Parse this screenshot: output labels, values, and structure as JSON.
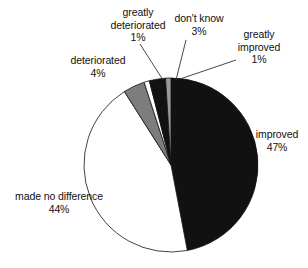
{
  "chart_data": {
    "type": "pie",
    "title": "",
    "subtitle": "",
    "xlabel": "",
    "ylabel": "",
    "legend_position": "none",
    "grid": false,
    "labels_outside": true,
    "start_angle_deg": 0,
    "direction": "clockwise",
    "categories": [
      "improved",
      "made no difference",
      "deteriorated",
      "greatly deteriorated",
      "don't know",
      "greatly improved"
    ],
    "values": [
      47,
      44,
      4,
      1,
      3,
      1
    ],
    "value_labels": [
      "47%",
      "44%",
      "4%",
      "1%",
      "3%",
      "1%"
    ],
    "colors": [
      "#111111",
      "#ffffff",
      "#7d7d7d",
      "#ffffff",
      "#111111",
      "#9a9a9a"
    ],
    "slice_border_color": "#111111",
    "units": "percent",
    "total": 100
  },
  "slices": [
    {
      "name": "improved",
      "percent_label": "47%",
      "color": "#111111",
      "start_pct": 0,
      "end_pct": 47,
      "explode": 0
    },
    {
      "name": "made no difference",
      "percent_label": "44%",
      "color": "#ffffff",
      "start_pct": 47,
      "end_pct": 91,
      "explode": 0
    },
    {
      "name": "deteriorated",
      "percent_label": "4%",
      "color": "#7d7d7d",
      "start_pct": 91,
      "end_pct": 95,
      "explode": 0
    },
    {
      "name": "greatly deteriorated",
      "percent_label": "1%",
      "color": "#ffffff",
      "start_pct": 95,
      "end_pct": 96,
      "explode": 0
    },
    {
      "name": "don't know",
      "percent_label": "3%",
      "color": "#111111",
      "start_pct": 96,
      "end_pct": 99,
      "explode": 0
    },
    {
      "name": "greatly improved",
      "percent_label": "1%",
      "color": "#9a9a9a",
      "start_pct": 99,
      "end_pct": 100,
      "explode": 0
    }
  ],
  "labels": {
    "greatly_deteriorated": {
      "line1": "greatly",
      "line2": "deteriorated",
      "percent": "1%"
    },
    "dont_know": {
      "line1": "don't know",
      "percent": "3%"
    },
    "greatly_improved": {
      "line1": "greatly",
      "line2": "improved",
      "percent": "1%"
    },
    "deteriorated": {
      "line1": "deteriorated",
      "percent": "4%"
    },
    "improved": {
      "line1": "improved",
      "percent": "47%"
    },
    "made_no_difference": {
      "line1": "made no difference",
      "percent": "44%"
    }
  },
  "geometry": {
    "center_x": 171,
    "center_y": 165,
    "radius": 87
  },
  "style": {
    "background": "#ffffff",
    "text_color": "#111111",
    "leader_line_color": "#333333"
  }
}
